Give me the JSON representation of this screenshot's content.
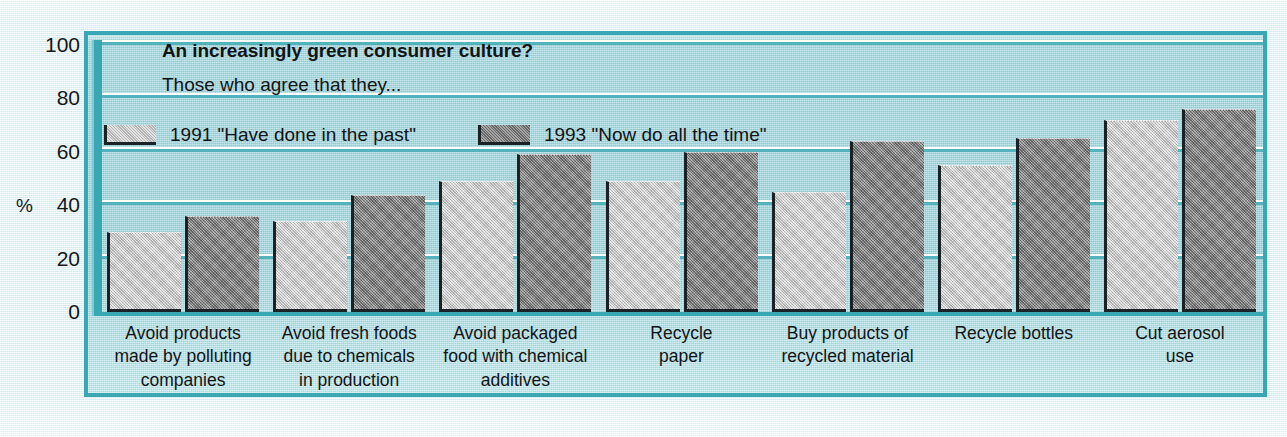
{
  "chart_data": {
    "type": "bar",
    "title": "An increasingly green consumer culture?",
    "subtitle": "Those who agree that they...",
    "xlabel": "",
    "ylabel": "%",
    "ylim": [
      0,
      100
    ],
    "yticks": [
      0,
      20,
      40,
      60,
      80,
      100
    ],
    "grid": true,
    "legend_position": "top-left",
    "categories": [
      "Avoid products made by polluting companies",
      "Avoid fresh foods due to chemicals in production",
      "Avoid packaged food with chemical additives",
      "Recycle paper",
      "Buy products of recycled material",
      "Recycle bottles",
      "Cut aerosol use"
    ],
    "category_lines": [
      [
        "Avoid products",
        "made by polluting",
        "companies"
      ],
      [
        "Avoid fresh foods",
        "due to chemicals",
        "in production"
      ],
      [
        "Avoid packaged",
        "food with chemical",
        "additives"
      ],
      [
        "Recycle",
        "paper"
      ],
      [
        "Buy products of",
        "recycled material"
      ],
      [
        "Recycle bottles"
      ],
      [
        "Cut aerosol",
        "use"
      ]
    ],
    "series": [
      {
        "name": "1991 \"Have done in the past\"",
        "color": "#c2c2c2",
        "values": [
          30,
          34,
          49,
          49,
          45,
          55,
          72
        ]
      },
      {
        "name": "1993 \"Now do all the time\"",
        "color": "#7e7e7e",
        "values": [
          36,
          44,
          59,
          60,
          64,
          65,
          76
        ]
      }
    ]
  },
  "legend": {
    "items": [
      {
        "label": "1991 \"Have done in the past\""
      },
      {
        "label": "1993 \"Now do all the time\""
      }
    ]
  },
  "axis": {
    "y_unit_label": "%",
    "ticks": [
      "100",
      "80",
      "60",
      "40",
      "20",
      "0"
    ]
  },
  "colors": {
    "panel_background": "#a3d8de",
    "panel_border": "#3aa8b4",
    "gridline": "#53b3bd",
    "page_background": "#e4f2f6",
    "series_1991": "#c2c2c2",
    "series_1993": "#7e7e7e",
    "text": "#101517"
  }
}
